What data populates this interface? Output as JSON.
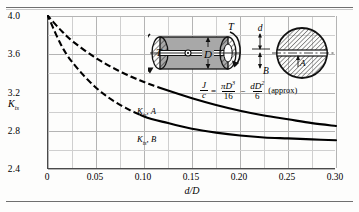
{
  "figure": {
    "name": "torsional-stress-concentration-chart"
  },
  "axes": {
    "y_label": "K",
    "y_label_sub": "ts",
    "x_label": "d/D",
    "y_ticks": [
      "4.0",
      "3.6",
      "3.2",
      "2.8",
      "2.4"
    ],
    "x_ticks": [
      "0",
      "0.05",
      "0.10",
      "0.15",
      "0.20",
      "0.25",
      "0.30"
    ]
  },
  "annotations": {
    "curve_a_label": "K",
    "curve_a_sub": "ts",
    "curve_a_suffix": ", A",
    "curve_b_label": "K",
    "curve_b_sub": "ts",
    "curve_b_suffix": ", B"
  },
  "equation": {
    "lhs_num": "J",
    "lhs_den": "c",
    "equals": "=",
    "t1_num": "πD",
    "t1_num_exp": "3",
    "t1_den": "16",
    "minus": "−",
    "t2_num": "dD",
    "t2_num_exp": "2",
    "t2_den": "6",
    "note": "(approx)"
  },
  "diagram": {
    "torque_label": "T",
    "torque_label_2": "T",
    "diameter_label": "D",
    "slot_depth_label": "d",
    "point_b_label": "B",
    "point_a_label": "A"
  },
  "chart_data": {
    "type": "line",
    "title": "",
    "xlabel": "d/D",
    "ylabel": "Kts",
    "xlim": [
      0,
      0.3
    ],
    "ylim": [
      2.4,
      4.0
    ],
    "grid": true,
    "legend": "inline-labels",
    "x_major_ticks": [
      0,
      0.05,
      0.1,
      0.15,
      0.2,
      0.25,
      0.3
    ],
    "y_major_ticks": [
      2.4,
      2.8,
      3.2,
      3.6,
      4.0
    ],
    "series": [
      {
        "name": "Kts, A",
        "x": [
          0,
          0.0125,
          0.025,
          0.05,
          0.075,
          0.1,
          0.125,
          0.15,
          0.175,
          0.2,
          0.225,
          0.25,
          0.275,
          0.3
        ],
        "values": [
          4.0,
          3.86,
          3.74,
          3.56,
          3.42,
          3.31,
          3.22,
          3.14,
          3.07,
          3.01,
          2.96,
          2.92,
          2.88,
          2.85
        ]
      },
      {
        "name": "Kts, B",
        "x": [
          0,
          0.0125,
          0.025,
          0.05,
          0.075,
          0.1,
          0.125,
          0.15,
          0.175,
          0.2,
          0.225,
          0.25,
          0.275,
          0.3
        ],
        "values": [
          4.0,
          3.72,
          3.52,
          3.25,
          3.07,
          2.95,
          2.88,
          2.82,
          2.78,
          2.75,
          2.73,
          2.72,
          2.71,
          2.7
        ]
      }
    ]
  }
}
